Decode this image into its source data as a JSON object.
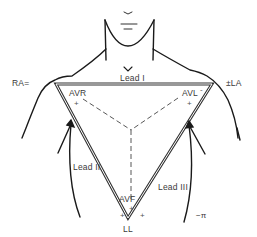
{
  "diagram": {
    "electrodes": {
      "ra": "RA=",
      "la": "±LA",
      "ll": "LL"
    },
    "leads": {
      "lead_i": "Lead I",
      "lead_ii": "Lead II",
      "lead_iii": "Lead III",
      "avr": "AVR",
      "avl": "AVL",
      "avf": "AVF"
    },
    "polarity": {
      "avr_plus": "+",
      "avl_plus": "+",
      "avf_plus": "+",
      "ll_left_plus": "+",
      "ll_right_plus": "+",
      "avl_minus": "-"
    },
    "ground_symbol": "−π",
    "colors": {
      "line": "#1a1a1a",
      "triangle_outer": "#333333",
      "triangle_inner": "#ffffff",
      "dashed": "#444444",
      "text": "#3a3a3a"
    }
  }
}
